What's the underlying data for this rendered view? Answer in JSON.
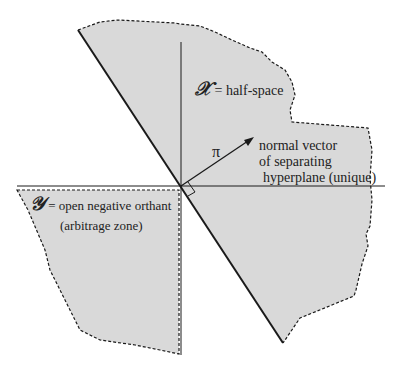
{
  "diagram": {
    "colors": {
      "region_fill": "#d9d9d9",
      "line": "#1a1a1a",
      "background": "#ffffff"
    },
    "labels": {
      "x_symbol": "𝒳",
      "x_text": " = half-space",
      "y_symbol": "𝒴",
      "y_text_line1": " = open negative orthant",
      "y_text_line2": "(arbitrage zone)",
      "pi": "π",
      "normal_line1": "normal vector",
      "normal_line2": "of separating",
      "normal_line3": "hyperplane (unique)"
    }
  }
}
